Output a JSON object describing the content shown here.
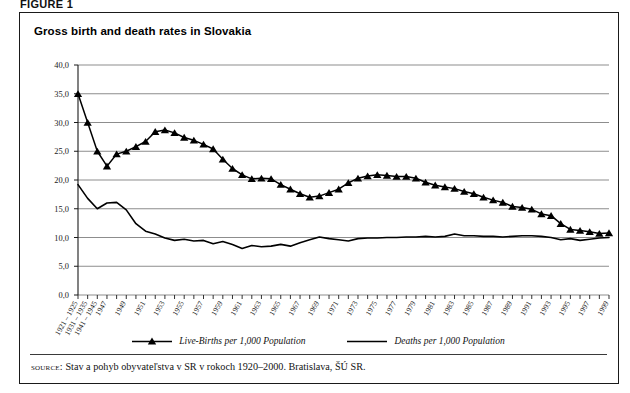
{
  "figure": {
    "label": "FIGURE 1",
    "title": "Gross birth and death rates in Slovakia",
    "source_label": "source:",
    "source_text": "Stav a pohyb obyvateľstva v SR v rokoch 1920–2000. Bratislava, ŠÚ SR."
  },
  "legend": {
    "items": [
      {
        "label": "Live-Births per 1,000 Population",
        "marker": "triangle-marker",
        "color": "#000000"
      },
      {
        "label": "Deaths per 1,000 Population",
        "marker": "line-marker",
        "color": "#000000"
      }
    ]
  },
  "chart_data": {
    "type": "line",
    "title": "Gross birth and death rates in Slovakia",
    "xlabel": "",
    "ylabel": "",
    "ylim": [
      0,
      40
    ],
    "ytick_labels": [
      "0,0",
      "5,0",
      "10,0",
      "15,0",
      "20,0",
      "25,0",
      "30,0",
      "35,0",
      "40,0"
    ],
    "ytick_values": [
      0,
      5,
      10,
      15,
      20,
      25,
      30,
      35,
      40
    ],
    "grid": true,
    "legend_position": "bottom",
    "categories": [
      "1921 – 1925",
      "1931 – 1935",
      "1941 – 1945",
      "1947",
      "1948",
      "1949",
      "1950",
      "1951",
      "1952",
      "1953",
      "1954",
      "1955",
      "1956",
      "1957",
      "1958",
      "1959",
      "1960",
      "1961",
      "1962",
      "1963",
      "1964",
      "1965",
      "1966",
      "1967",
      "1968",
      "1969",
      "1970",
      "1971",
      "1972",
      "1973",
      "1974",
      "1975",
      "1976",
      "1977",
      "1978",
      "1979",
      "1980",
      "1981",
      "1982",
      "1983",
      "1984",
      "1985",
      "1986",
      "1987",
      "1988",
      "1989",
      "1990",
      "1991",
      "1992",
      "1993",
      "1994",
      "1995",
      "1996",
      "1997",
      "1998",
      "1999"
    ],
    "xtick_labels_shown": [
      "1921 – 1925",
      "1931 – 1935",
      "1941 – 1945",
      "1947",
      "1949",
      "1951",
      "1953",
      "1955",
      "1957",
      "1959",
      "1961",
      "1963",
      "1965",
      "1967",
      "1969",
      "1971",
      "1973",
      "1975",
      "1977",
      "1979",
      "1981",
      "1983",
      "1985",
      "1987",
      "1989",
      "1991",
      "1993",
      "1995",
      "1997",
      "1999"
    ],
    "series": [
      {
        "name": "Live-Births per 1,000 Population",
        "marker": "triangle",
        "color": "#000000",
        "values": [
          35.0,
          30.0,
          25.0,
          22.4,
          24.5,
          25.0,
          25.8,
          26.7,
          28.4,
          28.7,
          28.2,
          27.4,
          26.9,
          26.2,
          25.4,
          23.6,
          22.0,
          20.9,
          20.2,
          20.3,
          20.2,
          19.2,
          18.4,
          17.6,
          17.0,
          17.2,
          17.8,
          18.4,
          19.5,
          20.3,
          20.7,
          20.9,
          20.8,
          20.6,
          20.6,
          20.3,
          19.6,
          19.1,
          18.8,
          18.5,
          18.0,
          17.6,
          17.0,
          16.5,
          16.1,
          15.4,
          15.2,
          14.9,
          14.1,
          13.8,
          12.4,
          11.4,
          11.2,
          11.0,
          10.7,
          10.8
        ]
      },
      {
        "name": "Deaths per 1,000 Population",
        "marker": "none",
        "color": "#000000",
        "values": [
          19.2,
          16.8,
          15.0,
          16.0,
          16.1,
          14.8,
          12.4,
          11.1,
          10.6,
          9.9,
          9.5,
          9.7,
          9.4,
          9.5,
          8.9,
          9.3,
          8.8,
          8.1,
          8.6,
          8.4,
          8.5,
          8.8,
          8.5,
          9.1,
          9.6,
          10.1,
          9.8,
          9.6,
          9.4,
          9.8,
          9.9,
          9.9,
          10.0,
          10.0,
          10.1,
          10.1,
          10.2,
          10.1,
          10.2,
          10.6,
          10.3,
          10.3,
          10.2,
          10.2,
          10.1,
          10.2,
          10.3,
          10.3,
          10.2,
          10.0,
          9.6,
          9.8,
          9.5,
          9.7,
          9.9,
          10.0
        ]
      }
    ]
  }
}
